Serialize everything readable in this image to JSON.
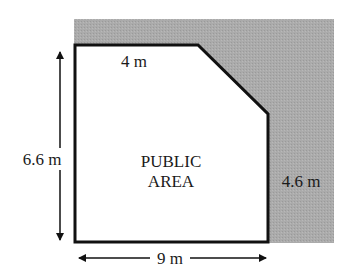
{
  "diagram": {
    "area_label_line1": "PUBLIC",
    "area_label_line2": "AREA",
    "dimensions": {
      "top_segment": "4 m",
      "left_height": "6.6 m",
      "right_height": "4.6 m",
      "bottom_width": "9 m"
    },
    "colors": {
      "shaded_region": "#a9a9a9",
      "outline": "#111111",
      "interior": "#ffffff"
    }
  }
}
